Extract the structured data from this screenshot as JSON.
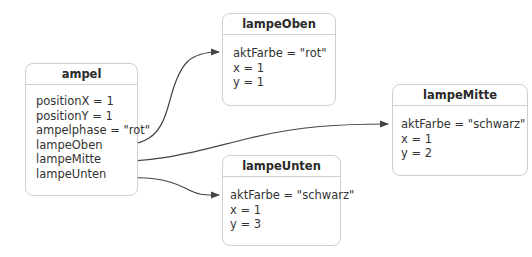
{
  "objects": {
    "ampel": {
      "name": "ampel",
      "attributes": [
        "positionX = 1",
        "positionY = 1",
        "ampelphase = \"rot\"",
        "lampeOben",
        "lampeMitte",
        "lampeUnten"
      ]
    },
    "lampeOben": {
      "name": "lampeOben",
      "attributes": [
        "aktFarbe = \"rot\"",
        "x = 1",
        "y = 1"
      ]
    },
    "lampeMitte": {
      "name": "lampeMitte",
      "attributes": [
        "aktFarbe = \"schwarz\"",
        "x = 1",
        "y = 2"
      ]
    },
    "lampeUnten": {
      "name": "lampeUnten",
      "attributes": [
        "aktFarbe = \"schwarz\"",
        "x = 1",
        "y = 3"
      ]
    }
  },
  "links": [
    {
      "from": "ampel.lampeOben",
      "to": "lampeOben"
    },
    {
      "from": "ampel.lampeMitte",
      "to": "lampeMitte"
    },
    {
      "from": "ampel.lampeUnten",
      "to": "lampeUnten"
    }
  ],
  "colors": {
    "border": "#cfcfcf",
    "arrow": "#444444",
    "text": "#333333"
  }
}
